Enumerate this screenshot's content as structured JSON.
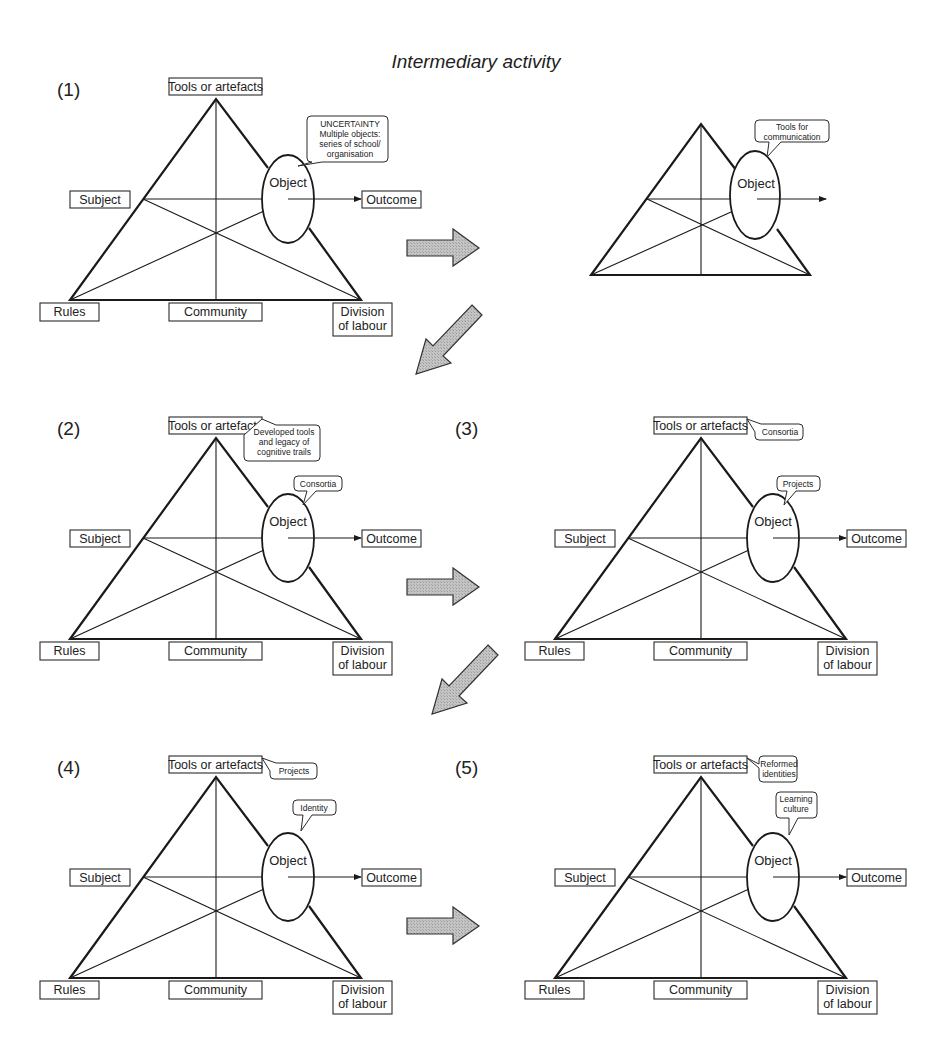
{
  "title": "Intermediary activity",
  "caption_partial": "Figure 4.11 Overall summary of transformations of the ...",
  "colors": {
    "line": "#1a1a1a",
    "arrow_fill": "#bdbdbd",
    "background": "#ffffff"
  },
  "node_labels": {
    "tools": "Tools or artefacts",
    "subject": "Subject",
    "object": "Object",
    "outcome": "Outcome",
    "rules": "Rules",
    "community": "Community",
    "division_line1": "Division",
    "division_line2": "of labour"
  },
  "panels": [
    {
      "id": "1",
      "number": "(1)",
      "object_bubble": [
        "UNCERTAINTY",
        "Multiple objects:",
        "series of school/",
        "organisation"
      ],
      "tools_bubble": []
    },
    {
      "id": "intermediary",
      "number": "",
      "object_bubble": [
        "Tools for",
        "communication"
      ],
      "tools_bubble": []
    },
    {
      "id": "2",
      "number": "(2)",
      "object_bubble": [
        "Consortia"
      ],
      "tools_bubble": [
        "Developed tools",
        "and legacy of",
        "cognitive trails"
      ]
    },
    {
      "id": "3",
      "number": "(3)",
      "object_bubble": [
        "Projects"
      ],
      "tools_bubble": [
        "Consortia"
      ]
    },
    {
      "id": "4",
      "number": "(4)",
      "object_bubble": [
        "Identity"
      ],
      "tools_bubble": [
        "Projects"
      ]
    },
    {
      "id": "5",
      "number": "(5)",
      "object_bubble": [
        "Learning",
        "culture"
      ],
      "tools_bubble": [
        "Reformed",
        "identities"
      ]
    }
  ],
  "transition_arrows": [
    {
      "from": "1",
      "to": "intermediary",
      "direction": "right"
    },
    {
      "from": "intermediary",
      "to": "2",
      "direction": "down-left"
    },
    {
      "from": "2",
      "to": "3",
      "direction": "right"
    },
    {
      "from": "3",
      "to": "4",
      "direction": "down-left"
    },
    {
      "from": "4",
      "to": "5",
      "direction": "right"
    }
  ]
}
